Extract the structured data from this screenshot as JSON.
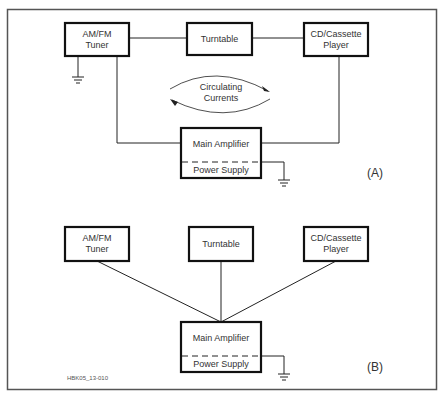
{
  "diagram": {
    "panel_a": {
      "tag": "(A)",
      "boxes": {
        "tuner": "AM/FM\nTuner",
        "turntable": "Turntable",
        "cd_player": "CD/Cassette\nPlayer",
        "amplifier": "Main Amplifier",
        "power_supply": "Power Supply"
      },
      "annotation": "Circulating\nCurrents"
    },
    "panel_b": {
      "tag": "(B)",
      "boxes": {
        "tuner": "AM/FM\nTuner",
        "turntable": "Turntable",
        "cd_player": "CD/Cassette\nPlayer",
        "amplifier": "Main Amplifier",
        "power_supply": "Power Supply"
      }
    },
    "figure_id": "HBK05_13-010"
  },
  "colors": {
    "line": "#222222",
    "border": "#555555",
    "text": "#333333"
  }
}
